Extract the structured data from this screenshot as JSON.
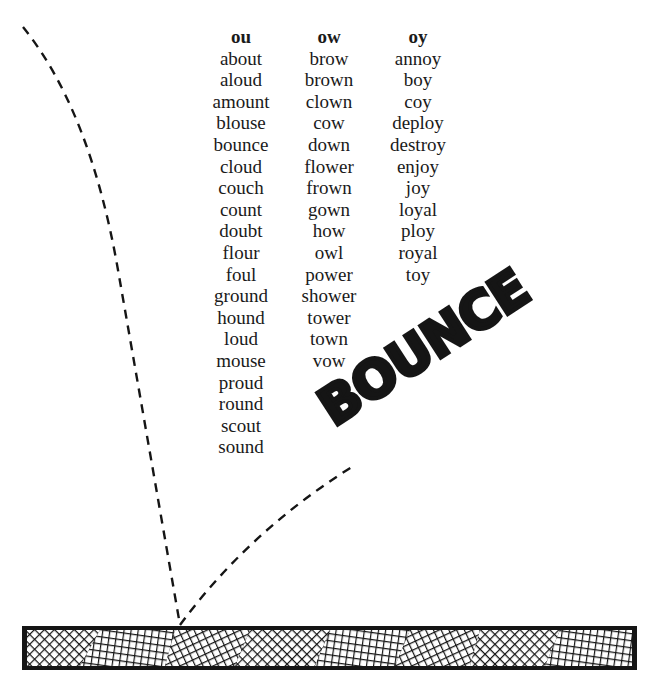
{
  "columns": [
    {
      "header": "ou",
      "words": [
        "about",
        "aloud",
        "amount",
        "blouse",
        "bounce",
        "cloud",
        "couch",
        "count",
        "doubt",
        "flour",
        "foul",
        "ground",
        "hound",
        "loud",
        "mouse",
        "proud",
        "round",
        "scout",
        "sound"
      ]
    },
    {
      "header": "ow",
      "words": [
        "brow",
        "brown",
        "clown",
        "cow",
        "down",
        "flower",
        "frown",
        "gown",
        "how",
        "owl",
        "power",
        "shower",
        "tower",
        "town",
        "vow"
      ]
    },
    {
      "header": "oy",
      "words": [
        "annoy",
        "boy",
        "coy",
        "deploy",
        "destroy",
        "enjoy",
        "joy",
        "loyal",
        "ploy",
        "royal",
        "toy"
      ]
    }
  ],
  "illustration": {
    "title_word": "BOUNCE",
    "elements": [
      "dashed-ball-trajectory",
      "crosshatch-floor-bar"
    ],
    "colors": {
      "ink": "#151515",
      "background": "#ffffff"
    }
  }
}
